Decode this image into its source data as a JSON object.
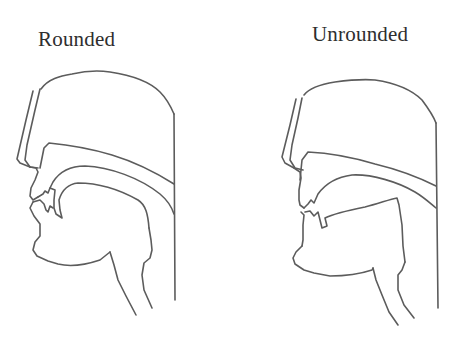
{
  "figure": {
    "type": "midsagittal vocal tract diagrams",
    "panels": [
      {
        "id": "rounded",
        "title": "Rounded"
      },
      {
        "id": "unrounded",
        "title": "Unrounded"
      }
    ],
    "colors": {
      "line": "#5c5c5c",
      "text": "#2e2e2e",
      "background": "#ffffff"
    }
  }
}
